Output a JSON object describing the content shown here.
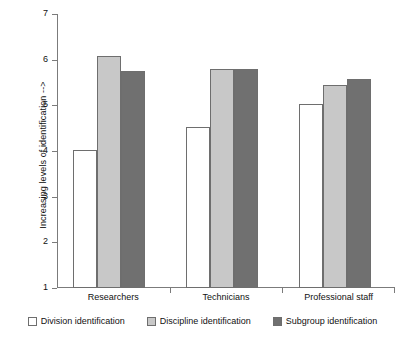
{
  "chart_data": {
    "type": "bar",
    "title": "",
    "subtitle": "",
    "xlabel": "",
    "ylabel": "Increasing levels of identification -->",
    "categories": [
      "Researchers",
      "Technicians",
      "Professional staff"
    ],
    "series": [
      {
        "name": "Division identification",
        "color": "#ffffff",
        "values": [
          4.03,
          4.52,
          5.04
        ]
      },
      {
        "name": "Discipline identification",
        "color": "#c8c8c8",
        "values": [
          6.08,
          5.8,
          5.45
        ]
      },
      {
        "name": "Subgroup identification",
        "color": "#707070",
        "values": [
          5.76,
          5.79,
          5.58
        ]
      }
    ],
    "ylim": [
      1,
      7
    ],
    "yticks": [
      "1",
      "2",
      "3",
      "4",
      "5",
      "6",
      "7"
    ],
    "grid": false,
    "legend_position": "bottom",
    "axis_color": "#7b7b7b",
    "bar_border_color": "#6e6e6e"
  }
}
